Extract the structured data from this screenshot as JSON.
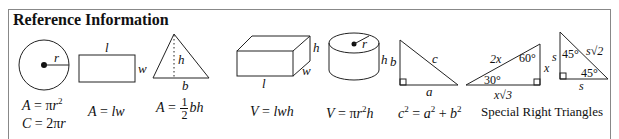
{
  "title": "Reference Information",
  "figures": {
    "circle": {
      "label_r": "r",
      "formula_area": "A = πr²",
      "formula_area_parts": [
        "A",
        " = π",
        "r",
        "2"
      ],
      "formula_circ_parts": [
        "C",
        " = 2π",
        "r"
      ]
    },
    "rectangle": {
      "label_l": "l",
      "label_w": "w",
      "formula_parts": [
        "A",
        " = ",
        "lw"
      ]
    },
    "triangle": {
      "label_h": "h",
      "label_b": "b",
      "formula_parts": [
        "A",
        " = ",
        "1",
        "2",
        "bh"
      ]
    },
    "box": {
      "label_h": "h",
      "label_w": "w",
      "label_l": "l",
      "formula_parts": [
        "V",
        " = ",
        "lwh"
      ]
    },
    "cylinder": {
      "label_r": "r",
      "label_h": "h",
      "formula_parts": [
        "V",
        " = π",
        "r",
        "2",
        "h"
      ]
    },
    "right_triangle": {
      "label_a": "a",
      "label_b": "b",
      "label_c": "c",
      "formula_parts": [
        "c",
        "2",
        " = ",
        "a",
        "2",
        " + ",
        "b",
        "2"
      ]
    },
    "special_30_60": {
      "hyp": "2x",
      "angle_top": "60°",
      "angle_bottom": "30°",
      "side_x": "x",
      "base": "x√3"
    },
    "special_45": {
      "side_left": "s",
      "angle_top": "45°",
      "hyp": "s√2",
      "angle_bottom": "45°",
      "base": "s"
    },
    "special_caption": "Special Right Triangles"
  }
}
